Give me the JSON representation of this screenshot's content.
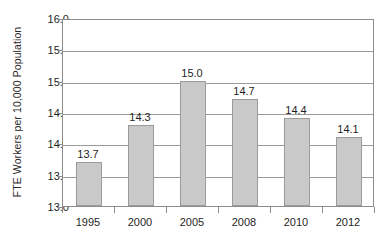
{
  "chart_data": {
    "type": "bar",
    "title": "",
    "subtitle": "",
    "xlabel": "",
    "ylabel": "FTE Workers per 10,000 Population",
    "categories": [
      "1995",
      "2000",
      "2005",
      "2008",
      "2010",
      "2012"
    ],
    "values": [
      13.7,
      14.3,
      15.0,
      14.7,
      14.4,
      14.1
    ],
    "data_labels": [
      "13.7",
      "14.3",
      "15.0",
      "14.7",
      "14.4",
      "14.1"
    ],
    "ylim": [
      13.0,
      16.0
    ],
    "ytick_labels": [
      "16.0",
      "15.5",
      "15.0",
      "14.5",
      "14.0",
      "13.5",
      "13.0"
    ],
    "ytick_values": [
      16.0,
      15.5,
      15.0,
      14.5,
      14.0,
      13.5,
      13.0
    ],
    "ytick_step": 0.5,
    "grid": "horizontal",
    "legend": "none",
    "bar_fill_color": "#c9c9c9",
    "bar_border_color": "#9b9b9b",
    "gridline_color": "#9a9a9a",
    "axis_color": "#8c8c8c",
    "text_color": "#1f1f1f",
    "background_color": "#ffffff"
  }
}
